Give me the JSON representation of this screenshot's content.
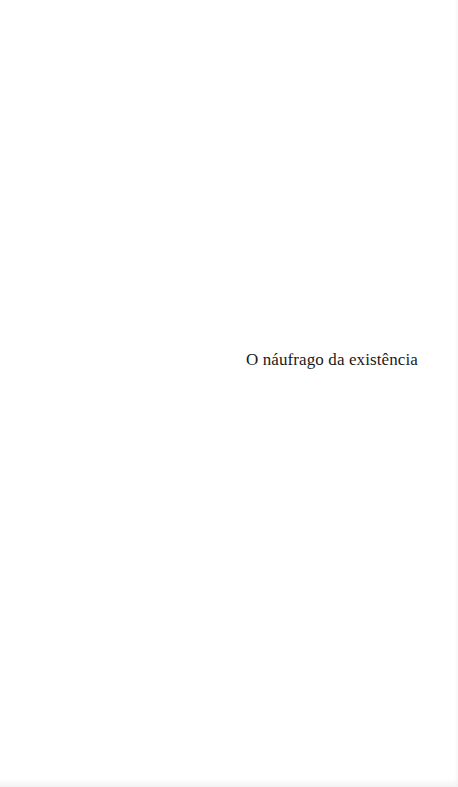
{
  "page": {
    "type": "half-title",
    "background_color": "#ffffff",
    "text_color": "#1a1a1a"
  },
  "half_title": {
    "text": "O náufrago da existência"
  }
}
